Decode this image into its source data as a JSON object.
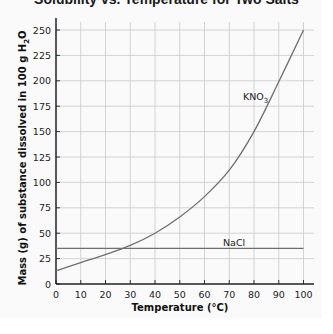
{
  "chart_data": {
    "type": "line",
    "title": "Solubility vs. Temperature for Two Salts",
    "xlabel": "Temperature (°C)",
    "ylabel": "Mass (g) of substance dissolved in 100 g H₂O",
    "xlim": [
      0,
      100
    ],
    "ylim": [
      0,
      250
    ],
    "xticks": [
      0,
      10,
      20,
      30,
      40,
      50,
      60,
      70,
      80,
      90,
      100
    ],
    "yticks": [
      0,
      25,
      50,
      75,
      100,
      125,
      150,
      175,
      200,
      225,
      250
    ],
    "grid": true,
    "legend": "inline labels",
    "x": [
      0,
      10,
      20,
      30,
      40,
      50,
      60,
      70,
      80,
      90,
      100
    ],
    "series": [
      {
        "name": "KNO₃",
        "values": [
          13,
          21,
          29,
          38,
          50,
          66,
          86,
          112,
          150,
          199,
          250
        ]
      },
      {
        "name": "NaCl",
        "values": [
          35,
          35,
          35,
          35,
          35,
          35,
          35,
          35,
          35,
          35,
          35
        ]
      }
    ],
    "annotations": [
      {
        "text": "KNO₃",
        "near_x": 75,
        "near_y": 185
      },
      {
        "text": "NaCl",
        "near_x": 70,
        "near_y": 37
      }
    ]
  },
  "labels": {
    "title": "Solubility vs. Temperature for Two Salts",
    "xlabel": "Temperature (°C)",
    "ylabel_main": "Mass (g) of substance dissolved in 100 g H",
    "ylabel_sub": "2",
    "ylabel_tail": "O",
    "kno3_main": "KNO",
    "kno3_sub": "3",
    "nacl": "NaCl"
  }
}
